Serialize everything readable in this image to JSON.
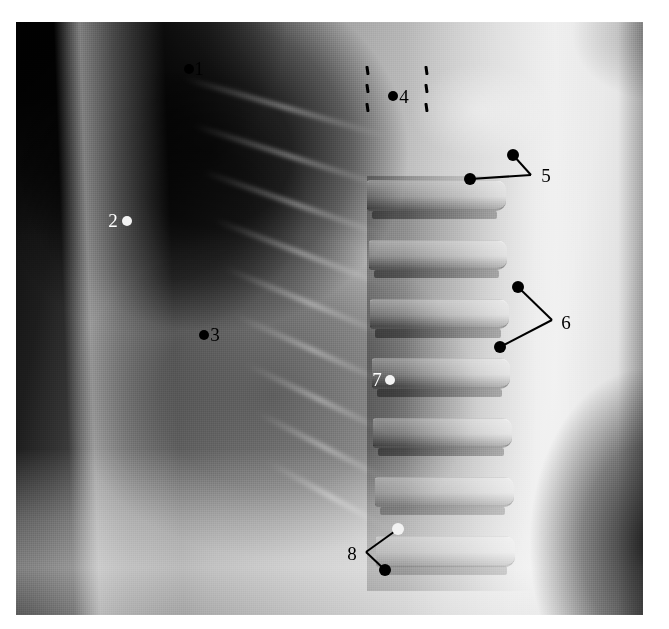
{
  "image": {
    "type": "radiograph",
    "modality": "x-ray",
    "view": "lateral chest",
    "caption": "Lateral chest radiograph with eight numbered annotation markers",
    "plate": {
      "x": 16,
      "y": 22,
      "width": 627,
      "height": 593
    },
    "background_color": "#ffffff"
  },
  "colors": {
    "marker_black": "#000000",
    "marker_white": "#f2f2f2",
    "label_black": "#000000",
    "label_white": "#ffffff"
  },
  "annotations": [
    {
      "id": 1,
      "label": "1",
      "label_color": "black",
      "label_x": 199,
      "label_y": 68,
      "style": "dot-with-adjacent-label",
      "dots": [
        {
          "x": 189,
          "y": 69,
          "color": "black",
          "r": 5
        }
      ],
      "leaders": []
    },
    {
      "id": 2,
      "label": "2",
      "label_color": "white",
      "label_x": 113,
      "label_y": 220,
      "style": "dot-with-adjacent-label",
      "dots": [
        {
          "x": 127,
          "y": 221,
          "color": "white",
          "r": 5
        }
      ],
      "leaders": []
    },
    {
      "id": 3,
      "label": "3",
      "label_color": "black",
      "label_x": 215,
      "label_y": 334,
      "style": "dot-with-adjacent-label",
      "dots": [
        {
          "x": 204,
          "y": 335,
          "color": "black",
          "r": 5
        }
      ],
      "leaders": []
    },
    {
      "id": 4,
      "label": "4",
      "label_color": "black",
      "label_x": 404,
      "label_y": 96,
      "style": "dot-with-adjacent-label-between-dashed-lines",
      "dots": [
        {
          "x": 393,
          "y": 96,
          "color": "black",
          "r": 5
        }
      ],
      "leaders": [],
      "dashed_lines": [
        {
          "x": 366,
          "y_top": 66,
          "y_bottom": 112,
          "tilt_deg": -8,
          "dashes": 3
        },
        {
          "x": 425,
          "y_top": 66,
          "y_bottom": 112,
          "tilt_deg": -8,
          "dashes": 3
        }
      ]
    },
    {
      "id": 5,
      "label": "5",
      "label_color": "black",
      "label_x": 546,
      "label_y": 175,
      "style": "two-dots-with-leader-lines",
      "vertex": {
        "x": 531,
        "y": 175
      },
      "dots": [
        {
          "x": 513,
          "y": 155,
          "color": "black",
          "r": 6
        },
        {
          "x": 470,
          "y": 179,
          "color": "black",
          "r": 6
        }
      ]
    },
    {
      "id": 6,
      "label": "6",
      "label_color": "black",
      "label_x": 566,
      "label_y": 322,
      "style": "two-dots-with-leader-lines",
      "vertex": {
        "x": 552,
        "y": 320
      },
      "dots": [
        {
          "x": 518,
          "y": 287,
          "color": "black",
          "r": 6
        },
        {
          "x": 500,
          "y": 347,
          "color": "black",
          "r": 6
        }
      ]
    },
    {
      "id": 7,
      "label": "7",
      "label_color": "white",
      "label_x": 377,
      "label_y": 379,
      "style": "dot-with-adjacent-label",
      "dots": [
        {
          "x": 390,
          "y": 380,
          "color": "white",
          "r": 5
        }
      ],
      "leaders": []
    },
    {
      "id": 8,
      "label": "8",
      "label_color": "black",
      "label_x": 352,
      "label_y": 553,
      "style": "two-dots-with-leader-lines",
      "vertex": {
        "x": 366,
        "y": 552
      },
      "dots": [
        {
          "x": 398,
          "y": 529,
          "color": "white",
          "r": 6
        },
        {
          "x": 385,
          "y": 570,
          "color": "black",
          "r": 6
        }
      ]
    }
  ],
  "anatomy_hints": {
    "dark_regions": [
      "anterior lung field",
      "retrosternal air space",
      "upper-left air"
    ],
    "bright_regions": [
      "posterior soft tissue",
      "vertebral bodies",
      "diaphragm"
    ],
    "vertebra_count": 7
  }
}
